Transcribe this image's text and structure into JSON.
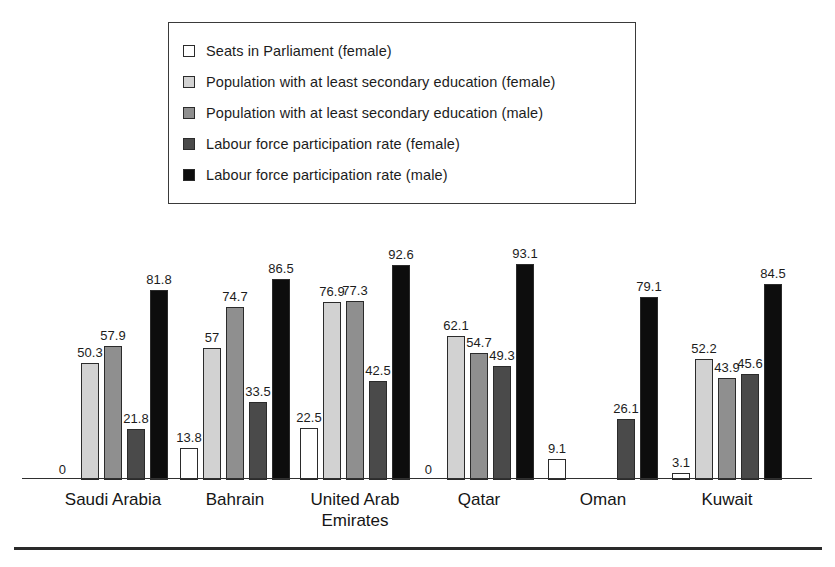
{
  "legend": {
    "items": [
      {
        "label": "Seats in Parliament (female)",
        "color": "#ffffff",
        "key": "seats_parliament_female"
      },
      {
        "label": "Population with at least secondary education (female)",
        "color": "#d2d2d2",
        "key": "secondary_education_female"
      },
      {
        "label": "Population with at least secondary education (male)",
        "color": "#8f8f8f",
        "key": "secondary_education_male"
      },
      {
        "label": "Labour force participation rate (female)",
        "color": "#4a4a4a",
        "key": "labour_force_female"
      },
      {
        "label": "Labour force participation rate (male)",
        "color": "#0d0d0d",
        "key": "labour_force_male"
      }
    ]
  },
  "chart_data": {
    "type": "bar",
    "title": "",
    "xlabel": "",
    "ylabel": "",
    "ylim": [
      0,
      100
    ],
    "grid": false,
    "legend_position": "top",
    "categories": [
      "Saudi Arabia",
      "Bahrain",
      "United Arab\nEmirates",
      "Qatar",
      "Oman",
      "Kuwait"
    ],
    "series": [
      {
        "name": "Seats in Parliament (female)",
        "color": "#ffffff",
        "values": [
          0,
          13.8,
          22.5,
          0,
          9.1,
          3.1
        ],
        "labels": [
          "0",
          "13.8",
          "22.5",
          "0",
          "9.1",
          "3.1"
        ]
      },
      {
        "name": "Population with at least secondary education (female)",
        "color": "#d2d2d2",
        "values": [
          50.3,
          57,
          76.9,
          62.1,
          null,
          52.2
        ],
        "labels": [
          "50.3",
          "57",
          "76.9",
          "62.1",
          "",
          "52.2"
        ]
      },
      {
        "name": "Population with at least secondary education (male)",
        "color": "#8f8f8f",
        "values": [
          57.9,
          74.7,
          77.3,
          54.7,
          null,
          43.9
        ],
        "labels": [
          "57.9",
          "74.7",
          "77.3",
          "54.7",
          "",
          "43.9"
        ]
      },
      {
        "name": "Labour force participation rate (female)",
        "color": "#4a4a4a",
        "values": [
          21.8,
          33.5,
          42.5,
          49.3,
          26.1,
          45.6
        ],
        "labels": [
          "21.8",
          "33.5",
          "42.5",
          "49.3",
          "26.1",
          "45.6"
        ]
      },
      {
        "name": "Labour force participation rate (male)",
        "color": "#0d0d0d",
        "values": [
          81.8,
          86.5,
          92.6,
          93.1,
          79.1,
          84.5
        ],
        "labels": [
          "81.8",
          "86.5",
          "92.6",
          "93.1",
          "79.1",
          "84.5"
        ]
      }
    ]
  }
}
